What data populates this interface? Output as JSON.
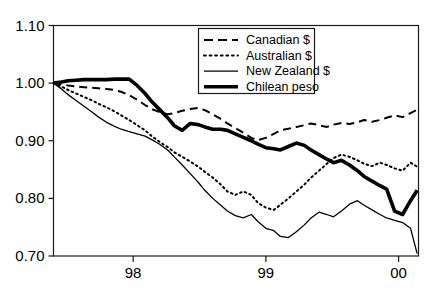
{
  "chart_data": {
    "type": "line",
    "title": "",
    "subtitle": "",
    "xlabel": "",
    "ylabel": "",
    "xlim": [
      1997.4,
      2000.15
    ],
    "ylim": [
      0.7,
      1.1
    ],
    "grid": false,
    "legend_position": "top-center",
    "x_tick_labels": [
      "98",
      "99",
      "00"
    ],
    "x_tick_values": [
      1998,
      1999,
      2000
    ],
    "y_tick_labels": [
      "0.70",
      "0.80",
      "0.90",
      "1.00",
      "1.10"
    ],
    "y_tick_values": [
      0.7,
      0.8,
      0.9,
      1.0,
      1.1
    ],
    "x": [
      1997.4,
      1997.46,
      1997.51,
      1997.57,
      1997.63,
      1997.69,
      1997.74,
      1997.8,
      1997.86,
      1997.91,
      1997.97,
      1998.03,
      1998.09,
      1998.14,
      1998.2,
      1998.26,
      1998.31,
      1998.37,
      1998.43,
      1998.49,
      1998.54,
      1998.6,
      1998.66,
      1998.71,
      1998.77,
      1998.83,
      1998.89,
      1998.94,
      1999.0,
      1999.06,
      1999.11,
      1999.17,
      1999.23,
      1999.29,
      1999.34,
      1999.4,
      1999.46,
      1999.51,
      1999.57,
      1999.63,
      1999.69,
      1999.74,
      1999.8,
      1999.86,
      1999.91,
      1999.97,
      2000.03,
      2000.09,
      2000.14
    ],
    "series": [
      {
        "name": "Canadian $",
        "style": "dashed",
        "color": "#000000",
        "width": 2.0,
        "values": [
          1.0,
          0.998,
          0.996,
          0.994,
          0.993,
          0.992,
          0.991,
          0.99,
          0.988,
          0.985,
          0.979,
          0.971,
          0.962,
          0.955,
          0.95,
          0.946,
          0.948,
          0.952,
          0.955,
          0.957,
          0.953,
          0.946,
          0.938,
          0.93,
          0.922,
          0.914,
          0.905,
          0.901,
          0.905,
          0.912,
          0.918,
          0.921,
          0.924,
          0.927,
          0.93,
          0.927,
          0.924,
          0.928,
          0.931,
          0.929,
          0.932,
          0.936,
          0.933,
          0.936,
          0.94,
          0.944,
          0.941,
          0.948,
          0.954
        ]
      },
      {
        "name": "Australian $",
        "style": "dotted",
        "color": "#000000",
        "width": 2.0,
        "values": [
          1.0,
          0.994,
          0.988,
          0.982,
          0.976,
          0.97,
          0.964,
          0.958,
          0.951,
          0.944,
          0.936,
          0.927,
          0.918,
          0.908,
          0.898,
          0.889,
          0.88,
          0.872,
          0.864,
          0.855,
          0.846,
          0.836,
          0.824,
          0.812,
          0.806,
          0.812,
          0.806,
          0.792,
          0.784,
          0.78,
          0.789,
          0.8,
          0.812,
          0.824,
          0.836,
          0.848,
          0.86,
          0.87,
          0.876,
          0.872,
          0.866,
          0.86,
          0.856,
          0.862,
          0.858,
          0.852,
          0.848,
          0.862,
          0.855
        ]
      },
      {
        "name": "New Zealand $",
        "style": "solid-thin",
        "color": "#000000",
        "width": 1.3,
        "values": [
          1.0,
          0.99,
          0.98,
          0.97,
          0.96,
          0.95,
          0.941,
          0.932,
          0.925,
          0.92,
          0.916,
          0.912,
          0.908,
          0.902,
          0.894,
          0.884,
          0.872,
          0.858,
          0.843,
          0.828,
          0.814,
          0.8,
          0.788,
          0.778,
          0.77,
          0.766,
          0.772,
          0.76,
          0.748,
          0.744,
          0.734,
          0.732,
          0.742,
          0.754,
          0.766,
          0.776,
          0.772,
          0.768,
          0.778,
          0.79,
          0.796,
          0.788,
          0.78,
          0.772,
          0.766,
          0.762,
          0.758,
          0.748,
          0.704
        ]
      },
      {
        "name": "Chilean peso",
        "style": "solid-thick",
        "color": "#000000",
        "width": 3.6,
        "values": [
          1.0,
          1.002,
          1.004,
          1.005,
          1.006,
          1.006,
          1.006,
          1.006,
          1.007,
          1.007,
          1.007,
          0.996,
          0.982,
          0.968,
          0.954,
          0.94,
          0.926,
          0.918,
          0.93,
          0.928,
          0.924,
          0.92,
          0.92,
          0.918,
          0.912,
          0.906,
          0.9,
          0.894,
          0.888,
          0.886,
          0.884,
          0.89,
          0.896,
          0.892,
          0.884,
          0.876,
          0.868,
          0.862,
          0.866,
          0.858,
          0.848,
          0.838,
          0.83,
          0.822,
          0.816,
          0.778,
          0.772,
          0.796,
          0.814
        ]
      }
    ]
  },
  "legend": {
    "entries": [
      {
        "label": "Canadian $"
      },
      {
        "label": "Australian $"
      },
      {
        "label": "New Zealand $"
      },
      {
        "label": "Chilean peso"
      }
    ]
  },
  "axes": {
    "y_labels": [
      "1.10",
      "1.00",
      "0.90",
      "0.80",
      "0.70"
    ],
    "x_labels": [
      "98",
      "99",
      "00"
    ]
  }
}
